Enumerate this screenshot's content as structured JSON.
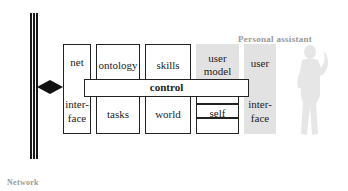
{
  "diagram": {
    "network": {
      "label": "Network"
    },
    "personal_assistant": {
      "label": "Personal assistant"
    },
    "modules": [
      {
        "id": "net-interface",
        "top": "net",
        "bottom": "inter-\nface",
        "top_text": "net",
        "bottom_line1": "inter-",
        "bottom_line2": "face"
      },
      {
        "id": "ontology-tasks",
        "top_text": "ontology",
        "bottom_text": "tasks"
      },
      {
        "id": "skills-world",
        "top_text": "skills",
        "bottom_text": "world"
      },
      {
        "id": "user-model-self",
        "top_line1": "user",
        "top_line2": "model",
        "bottom_text": "self"
      },
      {
        "id": "user-interface",
        "top_text": "user",
        "bottom_line1": "inter-",
        "bottom_line2": "face"
      }
    ],
    "control": {
      "label": "control"
    },
    "colors": {
      "line": "#222222",
      "shaded_module": "#e2e2e2",
      "caption": "#999999",
      "silhouette": "#e6e6e6"
    }
  }
}
